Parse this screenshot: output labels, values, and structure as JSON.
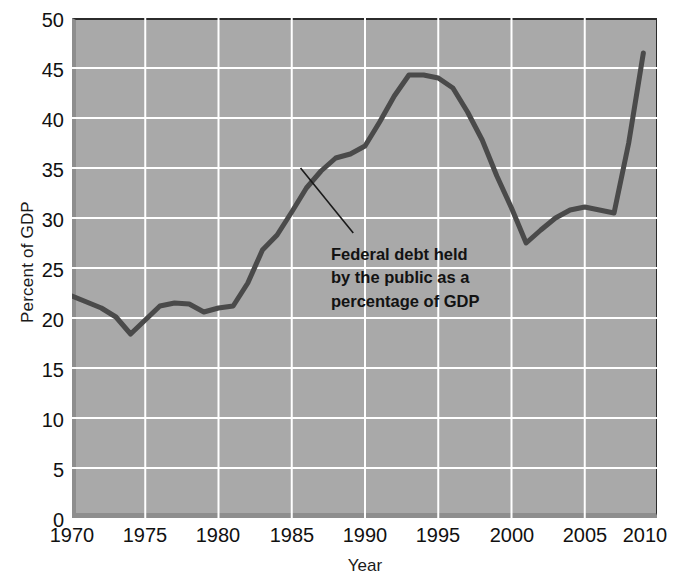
{
  "chart_data": {
    "type": "line",
    "title": "",
    "subtitle": "",
    "xlabel": "Year",
    "ylabel": "Percent of GDP",
    "xlim": [
      1970,
      2010
    ],
    "ylim": [
      0,
      50
    ],
    "xticks": [
      1970,
      1975,
      1980,
      1985,
      1990,
      1995,
      2000,
      2005,
      2010
    ],
    "yticks": [
      0,
      5,
      10,
      15,
      20,
      25,
      30,
      35,
      40,
      45,
      50
    ],
    "grid": true,
    "legend": null,
    "legend_position": "none",
    "plot_background": "#a9a9a9",
    "gridline_color": "#ffffff",
    "line_color": "#4a4a4a",
    "line_width": 5,
    "annotations": [
      {
        "name": "series-callout",
        "lines": [
          "Federal debt held",
          "by the public as a",
          "percentage of GDP"
        ],
        "leader_from": [
          1985.6,
          35.0
        ],
        "leader_to": [
          1989.2,
          28.5
        ]
      }
    ],
    "series": [
      {
        "name": "Federal debt held by the public as a percentage of GDP",
        "x": [
          1970,
          1971,
          1972,
          1973,
          1974,
          1975,
          1976,
          1977,
          1978,
          1979,
          1980,
          1981,
          1982,
          1983,
          1984,
          1985,
          1986,
          1987,
          1988,
          1989,
          1990,
          1991,
          1992,
          1993,
          1994,
          1995,
          1996,
          1997,
          1998,
          1999,
          2000,
          2001,
          2002,
          2003,
          2004,
          2005,
          2006,
          2007,
          2008,
          2009
        ],
        "values": [
          22.2,
          21.6,
          21.0,
          20.1,
          18.4,
          19.8,
          21.2,
          21.5,
          21.4,
          20.6,
          21.0,
          21.2,
          23.5,
          26.8,
          28.3,
          30.6,
          33.0,
          34.7,
          36.0,
          36.4,
          37.2,
          39.6,
          42.2,
          44.3,
          44.3,
          44.0,
          43.0,
          40.6,
          37.8,
          34.2,
          31.0,
          27.5,
          28.8,
          30.0,
          30.8,
          31.1,
          30.8,
          30.5,
          37.5,
          46.5
        ]
      }
    ]
  },
  "axes": {
    "ytick_labels": [
      "50",
      "45",
      "40",
      "35",
      "30",
      "25",
      "20",
      "15",
      "10",
      "5",
      "0"
    ],
    "xtick_labels": [
      "1970",
      "1975",
      "1980",
      "1985",
      "1990",
      "1995",
      "2000",
      "2005",
      "2010"
    ],
    "ylabel_text": "Percent of GDP",
    "xlabel_text": "Year"
  },
  "annotation_text": {
    "line1": "Federal debt held",
    "line2": "by the public as a",
    "line3": "percentage of GDP"
  }
}
